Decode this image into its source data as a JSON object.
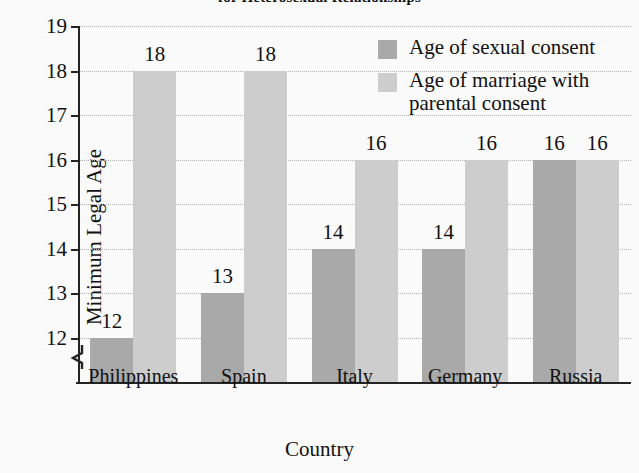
{
  "chart_data": {
    "type": "bar",
    "title": "for Heterosexual Relationships",
    "xlabel": "Country",
    "ylabel": "Minimum Legal Age",
    "categories": [
      "Philippines",
      "Spain",
      "Italy",
      "Germany",
      "Russia"
    ],
    "series": [
      {
        "name": "Age of sexual consent",
        "color": "#a9a9a9",
        "values": [
          12,
          13,
          14,
          14,
          16
        ]
      },
      {
        "name": "Age of marriage with parental consent",
        "color": "#cdcdcd",
        "values": [
          18,
          18,
          16,
          16,
          16
        ]
      }
    ],
    "ylim": [
      11,
      19
    ],
    "y_ticks": [
      12,
      13,
      14,
      15,
      16,
      17,
      18,
      19
    ],
    "y_axis_broken": true,
    "grid": true,
    "grid_style": "dotted-horizontal",
    "legend_position": "inside-top-right",
    "value_labels": true,
    "background_color": "#fafafa",
    "axis_color": "#242424"
  },
  "legend": {
    "items": [
      {
        "label": "Age of sexual consent"
      },
      {
        "label": "Age of marriage with parental consent"
      }
    ]
  }
}
